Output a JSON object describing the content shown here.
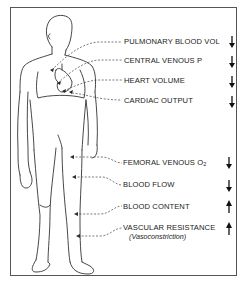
{
  "diagram": {
    "type": "human-figure-annotation",
    "upper_labels": [
      {
        "id": "pulmonary",
        "text": "PULMONARY BLOOD VOL",
        "direction": "down",
        "arrow": "↓"
      },
      {
        "id": "cvp",
        "text": "CENTRAL VENOUS P",
        "direction": "down",
        "arrow": "↓"
      },
      {
        "id": "heart",
        "text": "HEART VOLUME",
        "direction": "down",
        "arrow": "↓"
      },
      {
        "id": "cardiac",
        "text": "CARDIAC OUTPUT",
        "direction": "down",
        "arrow": "↓"
      }
    ],
    "lower_labels": [
      {
        "id": "femoral",
        "text": "FEMORAL VENOUS O",
        "subscript": "2",
        "direction": "down",
        "arrow": "↓"
      },
      {
        "id": "flow",
        "text": "BLOOD FLOW",
        "direction": "down",
        "arrow": "↓"
      },
      {
        "id": "content",
        "text": "BLOOD CONTENT",
        "direction": "up",
        "arrow": "↑"
      },
      {
        "id": "resistance",
        "text": "VASCULAR RESISTANCE",
        "direction": "up",
        "arrow": "↑"
      }
    ],
    "resistance_note": "(Vasoconstriction)",
    "colors": {
      "line": "#333333",
      "frame": "#555555",
      "background": "#ffffff"
    }
  }
}
